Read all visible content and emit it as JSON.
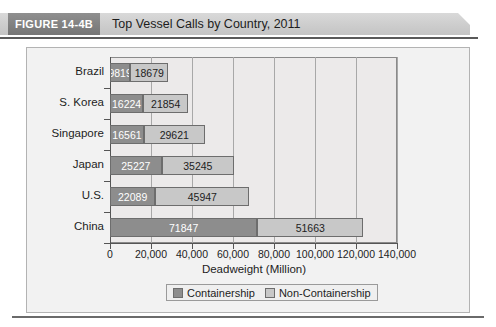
{
  "figure": {
    "tag_label": "FIGURE 14-4B",
    "title": "Top Vessel Calls by Country, 2011"
  },
  "legend": {
    "position": "bottom-center",
    "items": [
      {
        "label": "Containership",
        "color": "#8d8d8d"
      },
      {
        "label": "Non-Containership",
        "color": "#c8c8c8"
      }
    ]
  },
  "chart_data": {
    "type": "bar",
    "orientation": "horizontal",
    "stacked": true,
    "title": "Top Vessel Calls by Country, 2011",
    "xlabel": "Deadweight (Million)",
    "ylabel": "",
    "xlim": [
      0,
      140000
    ],
    "xticks": [
      0,
      20000,
      40000,
      60000,
      80000,
      100000,
      120000,
      140000
    ],
    "xtick_labels": [
      "0",
      "20,000",
      "40,000",
      "60,000",
      "80,000",
      "100,000",
      "120,000",
      "140,000"
    ],
    "grid": true,
    "legend_position": "bottom-center",
    "categories": [
      "Brazil",
      "S. Korea",
      "Singapore",
      "Japan",
      "U.S.",
      "China"
    ],
    "series": [
      {
        "name": "Containership",
        "color": "#8d8d8d",
        "values": [
          9819,
          16224,
          16561,
          25227,
          22089,
          71847
        ],
        "labels": [
          "9819",
          "16224",
          "16561",
          "25227",
          "22089",
          "71847"
        ]
      },
      {
        "name": "Non-Containership",
        "color": "#c8c8c8",
        "values": [
          18679,
          21854,
          29621,
          35245,
          45947,
          51663
        ],
        "labels": [
          "18679",
          "21854",
          "29621",
          "35245",
          "45947",
          "51663"
        ]
      }
    ],
    "totals": [
      28498,
      38078,
      46182,
      60472,
      68036,
      123510
    ]
  }
}
